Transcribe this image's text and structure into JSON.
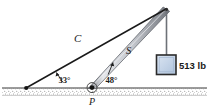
{
  "figure": {
    "labels": {
      "cable": "C",
      "strut": "S",
      "pin": "P",
      "angle_cable": "33°",
      "angle_strut": "48°",
      "weight": "513 lb"
    },
    "colors": {
      "line": "#1a1a1a",
      "ground_line": "#3a3a3a",
      "ground_hatch": "#8a8a8a",
      "strut_fill": "#b9bcc2",
      "strut_highlight": "#e6e8ec",
      "strut_shadow": "#6e7279",
      "rope": "#6d7177",
      "block_fill": "#c2d2e6",
      "block_border": "#2b2b2b",
      "background": "#ffffff"
    },
    "geometry": {
      "ground_y": 88,
      "anchor_x": 26,
      "pin_x": 92,
      "apex_x": 166,
      "apex_y": 10,
      "block_x": 155,
      "block_y": 55,
      "block_size": 19
    }
  }
}
